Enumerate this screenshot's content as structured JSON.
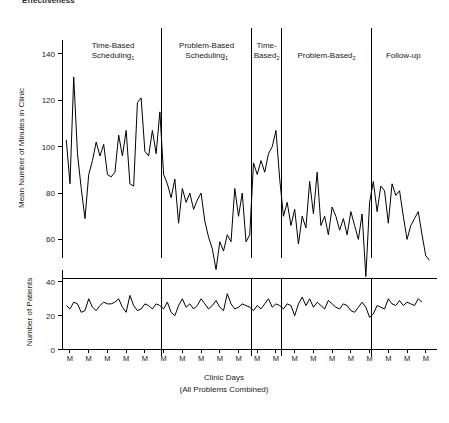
{
  "top_caption": "Effectiveness",
  "chart_data": {
    "type": "line",
    "title": "",
    "xlabel": "Clinic Days",
    "xlabel_sub": "(All Problems Combined)",
    "grid": false,
    "legend": "none",
    "x_tick_label": "M",
    "phases": [
      {
        "id": "tbs1",
        "label_line1": "Time-Based",
        "label_line2": "Scheduling",
        "subscript": "1",
        "n_points": 26
      },
      {
        "id": "pbs1",
        "label_line1": "Problem-Based",
        "label_line2": "Scheduling",
        "subscript": "1",
        "n_points": 24
      },
      {
        "id": "tb2",
        "label_line1": "Time-",
        "label_line2": "Based",
        "subscript": "2",
        "n_points": 8
      },
      {
        "id": "pb2",
        "label_line1": "Problem-Based",
        "label_line2": "",
        "subscript": "2",
        "n_points": 24
      },
      {
        "id": "followup",
        "label_line1": "Follow-up",
        "label_line2": "",
        "subscript": "",
        "n_points": 17
      }
    ],
    "panels": [
      {
        "id": "minutes",
        "ylabel": "Mean Number of Minutes in Clinic",
        "ylim": [
          52,
          146
        ],
        "yticks": [
          60,
          80,
          100,
          120,
          140
        ],
        "series": [
          {
            "name": "Mean Number of Minutes in Clinic",
            "values": [
              103,
              84,
              130,
              97,
              82,
              69,
              88,
              94,
              102,
              96,
              101,
              88,
              87,
              89,
              105,
              96,
              107,
              84,
              83,
              119,
              121,
              98,
              96,
              107,
              97,
              115,
              88,
              84,
              78,
              86,
              67,
              82,
              76,
              80,
              73,
              77,
              80,
              68,
              61,
              56,
              47,
              59,
              55,
              62,
              59,
              82,
              70,
              80,
              59,
              62,
              93,
              88,
              94,
              89,
              97,
              100,
              107,
              86,
              70,
              76,
              66,
              73,
              58,
              70,
              65,
              85,
              71,
              89,
              66,
              70,
              62,
              74,
              70,
              64,
              69,
              62,
              72,
              66,
              60,
              71,
              44,
              76,
              85,
              72,
              83,
              81,
              67,
              84,
              79,
              81,
              70,
              60,
              66,
              69,
              72,
              62,
              53,
              51
            ]
          }
        ]
      },
      {
        "id": "patients",
        "ylabel": "Number of Patients",
        "ylim": [
          0,
          42
        ],
        "yticks": [
          0,
          20,
          40
        ],
        "series": [
          {
            "name": "Number of Patients",
            "values": [
              26,
              24,
              28,
              27,
              22,
              23,
              30,
              25,
              23,
              26,
              28,
              27,
              27,
              28,
              30,
              25,
              22,
              32,
              26,
              23,
              24,
              27,
              26,
              24,
              27,
              26,
              24,
              28,
              22,
              20,
              26,
              30,
              25,
              27,
              24,
              26,
              30,
              27,
              24,
              26,
              29,
              25,
              23,
              33,
              27,
              24,
              25,
              27,
              26,
              25,
              23,
              26,
              24,
              27,
              30,
              25,
              27,
              26,
              24,
              27,
              26,
              20,
              27,
              31,
              26,
              30,
              25,
              28,
              26,
              24,
              29,
              27,
              25,
              24,
              27,
              26,
              23,
              22,
              25,
              28,
              25,
              19,
              21,
              26,
              25,
              24,
              30,
              27,
              26,
              29,
              26,
              28,
              27,
              26,
              30,
              28
            ]
          }
        ]
      }
    ]
  }
}
